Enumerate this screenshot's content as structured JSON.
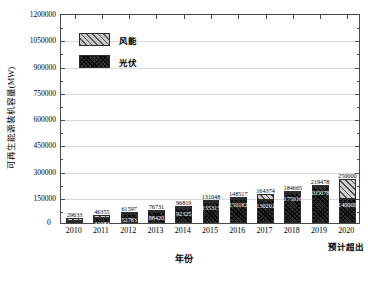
{
  "chart_data": {
    "type": "bar",
    "title": "",
    "subtitle": "",
    "xlabel": "年份",
    "ylabel": "可再生能源装机容量(MW)",
    "ylim": [
      0,
      1200000
    ],
    "ytick_step": 150000,
    "ytick_labels": [
      "1200000",
      "1050000",
      "900000",
      "750000",
      "600000",
      "450000",
      "300000",
      "150000",
      "0"
    ],
    "grid": "horizontal",
    "stacked": true,
    "legend_position": "top-left",
    "categories": [
      "2010",
      "2011",
      "2012",
      "2013",
      "2014",
      "2015",
      "2016",
      "2017",
      "2018",
      "2019",
      "2020"
    ],
    "series": [
      {
        "name": "光伏",
        "color": "#333333",
        "pattern": "dense-crosshatch",
        "values": [
          1022,
          31083,
          52783,
          88420,
          92325,
          135315,
          150182,
          130201,
          175016,
          205078,
          140000
        ],
        "labels": [
          "1022",
          "31083",
          "52783",
          "88420",
          "92325",
          "135315",
          "150182",
          "130201",
          "175016",
          "205078",
          "140000"
        ]
      },
      {
        "name": "风能",
        "color": "#cfcfcf",
        "pattern": "diagonal-hatch",
        "values": [
          28611,
          15272,
          8814,
          -11689,
          4494,
          -4267,
          -1665,
          34173,
          9649,
          14400,
          110000
        ]
      }
    ],
    "totals": [
      29633,
      46355,
      61597,
      76731,
      96819,
      131048,
      148517,
      164374,
      184665,
      219478,
      250000
    ],
    "total_labels": [
      "29633",
      "46355",
      "61597",
      "76731",
      "96819",
      "131048",
      "148517",
      "164374",
      "184665",
      "219478",
      "250000"
    ],
    "annotations": [
      {
        "text": "预计超出",
        "near_category": "2020"
      }
    ]
  },
  "legend": {
    "items": [
      {
        "label": "风能",
        "swatch": "wind-hatch-swatch"
      },
      {
        "label": "光伏",
        "swatch": "solar-dark-swatch"
      }
    ]
  },
  "axes": {
    "zero_label": "0"
  }
}
